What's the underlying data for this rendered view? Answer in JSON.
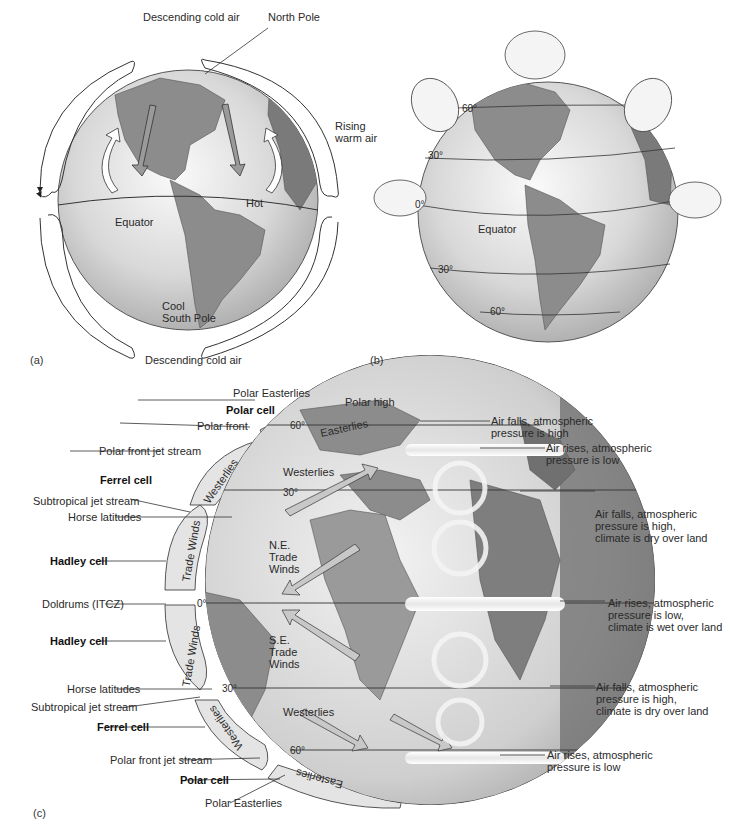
{
  "panel_a": {
    "letter": "(a)",
    "labels": {
      "descending_top": "Descending cold air",
      "north_pole": "North Pole",
      "rising_warm_air": "Rising\nwarm air",
      "hot": "Hot",
      "equator": "Equator",
      "cool_south_pole": "Cool\nSouth Pole",
      "descending_bottom": "Descending cold air"
    }
  },
  "panel_b": {
    "letter": "(b)",
    "latitudes": [
      "60°",
      "30°",
      "0°",
      "30°",
      "60°"
    ],
    "equator": "Equator"
  },
  "panel_c": {
    "letter": "(c)",
    "left_labels": [
      {
        "text": "Polar Easterlies",
        "bold": false
      },
      {
        "text": "Polar cell",
        "bold": true
      },
      {
        "text": "Polar front",
        "bold": false
      },
      {
        "text": "Polar front jet stream",
        "bold": false
      },
      {
        "text": "Ferrel cell",
        "bold": true
      },
      {
        "text": "Subtropical jet stream",
        "bold": false
      },
      {
        "text": "Horse latitudes",
        "bold": false
      },
      {
        "text": "Hadley cell",
        "bold": true
      },
      {
        "text": "Doldrums (ITCZ)",
        "bold": false
      },
      {
        "text": "Hadley cell",
        "bold": true
      },
      {
        "text": "Horse latitudes",
        "bold": false
      },
      {
        "text": "Subtropical jet stream",
        "bold": false
      },
      {
        "text": "Ferrel cell",
        "bold": true
      },
      {
        "text": "Polar front jet stream",
        "bold": false
      },
      {
        "text": "Polar cell",
        "bold": true
      },
      {
        "text": "Polar Easterlies",
        "bold": false
      }
    ],
    "top_labels": {
      "polar_high": "Polar high"
    },
    "globe_labels": {
      "westerlies_n": "Westerlies",
      "ne_trade": "N.E.\nTrade\nWinds",
      "se_trade": "S.E.\nTrade\nWinds",
      "westerlies_s": "Westerlies",
      "lat_60n": "60°",
      "lat_30n": "30°",
      "lat_0": "0°",
      "lat_30s": "30°",
      "lat_60s": "60°"
    },
    "cell_labels": {
      "easterlies_n": "Easterlies",
      "westerlies_n": "Westerlies",
      "trade_n": "Trade Winds",
      "trade_s": "Trade Winds",
      "westerlies_s": "Westerlies",
      "easterlies_s": "Easterlies"
    },
    "right_labels": [
      "Air falls, atmospheric\npressure is high",
      "Air rises, atmospheric\npressure is low",
      "Air falls, atmospheric\npressure is high,\nclimate is dry over land",
      "Air rises, atmospheric\npressure is low,\nclimate is wet over land",
      "Air falls, atmospheric\npressure is high,\nclimate is dry over land",
      "Air rises, atmospheric\npressure is low"
    ]
  },
  "colors": {
    "ocean_light": "#e9e9e9",
    "ocean_dark": "#b5b5b5",
    "land": "#8c8c8c",
    "land_dark": "#6e6e6e",
    "cell": "#e4e4e4",
    "line": "#333333"
  }
}
